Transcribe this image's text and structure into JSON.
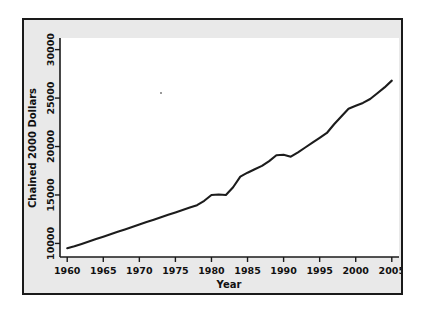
{
  "figure": {
    "background_color": "#e9e9e9",
    "plot_background_color": "#ffffff",
    "border_color": "#1a1a1a",
    "line_color": "#1c1c1c"
  },
  "chart_data": {
    "type": "line",
    "title": "",
    "xlabel": "Year",
    "ylabel": "Chained 2000 Dollars",
    "xlim": [
      1959,
      2006
    ],
    "ylim": [
      8600,
      31200
    ],
    "grid": false,
    "legend": null,
    "xticks": [
      1960,
      1965,
      1970,
      1975,
      1980,
      1985,
      1990,
      1995,
      2000,
      2005
    ],
    "xtick_labels": [
      "1960",
      "1965",
      "1970",
      "1975",
      "1980",
      "1985",
      "1990",
      "1995",
      "2000",
      "2005"
    ],
    "yticks": [
      10000,
      15000,
      20000,
      25000,
      30000
    ],
    "ytick_labels": [
      "10000",
      "15000",
      "20000",
      "25000",
      "30000"
    ],
    "series": [
      {
        "name": "Chained 2000 Dollars",
        "x": [
          1960,
          1961,
          1962,
          1963,
          1964,
          1965,
          1966,
          1967,
          1968,
          1969,
          1970,
          1971,
          1972,
          1973,
          1974,
          1975,
          1976,
          1977,
          1978,
          1979,
          1980,
          1981,
          1982,
          1983,
          1984,
          1985,
          1986,
          1987,
          1988,
          1989,
          1990,
          1991,
          1992,
          1993,
          1994,
          1995,
          1996,
          1997,
          1998,
          1999,
          2000,
          2001,
          2002,
          2003,
          2004,
          2005
        ],
        "values": [
          9500,
          9700,
          9950,
          10200,
          10450,
          10700,
          10950,
          11200,
          11450,
          11700,
          11950,
          12200,
          12450,
          12700,
          12950,
          13200,
          13450,
          13700,
          13950,
          14400,
          15000,
          15050,
          15000,
          15800,
          16900,
          17300,
          17650,
          18000,
          18500,
          19100,
          19150,
          18950,
          19400,
          19900,
          20400,
          20900,
          21400,
          22300,
          23100,
          23900,
          24200,
          24500,
          24900,
          25500,
          26100,
          26800
        ]
      }
    ]
  }
}
